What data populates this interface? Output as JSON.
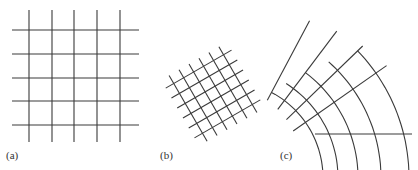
{
  "figure": {
    "line_color": "#3a3a3a",
    "background": "#ffffff",
    "panels": [
      {
        "id": "a",
        "label": "(a)",
        "description": "Regular square grid",
        "label_pos": [
          6,
          150
        ],
        "vertical_x": [
          29,
          52,
          74,
          97,
          120
        ],
        "vertical_y_range": [
          10,
          142
        ],
        "horizontal_y": [
          30,
          54,
          78,
          101,
          125
        ],
        "horizontal_x_range": [
          12,
          139
        ]
      },
      {
        "id": "b",
        "label": "(b)",
        "description": "Rotated square grid",
        "label_pos": [
          160,
          150
        ],
        "center": [
          213,
          94
        ],
        "rotation_deg": -30,
        "spacing": 11.5,
        "lines_per_direction": 6,
        "half_length": 38
      },
      {
        "id": "c",
        "label": "(c)",
        "description": "Curvilinear (polar) grid",
        "label_pos": [
          280,
          150
        ],
        "center": [
          226,
          178
        ],
        "radii": [
          97,
          112,
          132,
          155,
          183
        ],
        "arc_angle_range_deg": [
          -12,
          62
        ],
        "radial_angles_deg": [
          26,
          35,
          44,
          53,
          62
        ],
        "radial_r_range": [
          82,
          196
        ]
      }
    ]
  }
}
